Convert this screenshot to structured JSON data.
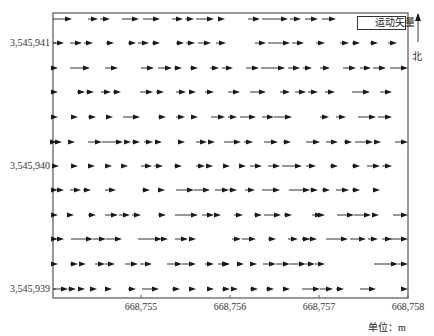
{
  "chart_data": {
    "type": "quiver",
    "title": "",
    "xlabel": "",
    "ylabel": "",
    "unit_label": "单位：m",
    "legend": [
      {
        "label": "运动矢量",
        "symbol": "arrow"
      }
    ],
    "north_label": "北",
    "x_ticks": [
      {
        "label": "668,755",
        "px": 141
      },
      {
        "label": "668,756",
        "px": 230
      },
      {
        "label": "668,757",
        "px": 319
      },
      {
        "label": "668,758",
        "px": 408
      }
    ],
    "y_ticks": [
      {
        "label": "3,545,941",
        "px": 43
      },
      {
        "label": "3,545,940",
        "px": 166
      },
      {
        "label": "3,545,939",
        "px": 289
      }
    ],
    "xlim": [
      668754.0,
      668758.0
    ],
    "ylim": [
      3545938.93,
      3545941.25
    ],
    "grid": false,
    "direction": "east",
    "frame": {
      "left": 53,
      "top": 13,
      "right": 408,
      "bottom": 298
    },
    "rows": [
      {
        "y": 19,
        "arrows": [
          [
            53,
            72
          ],
          [
            88,
            98
          ],
          [
            100,
            110
          ],
          [
            122,
            139
          ],
          [
            143,
            160
          ],
          [
            172,
            183
          ],
          [
            185,
            194
          ],
          [
            196,
            214
          ],
          [
            218,
            225
          ],
          [
            248,
            260
          ],
          [
            262,
            288
          ],
          [
            290,
            301
          ],
          [
            305,
            318
          ],
          [
            322,
            336
          ]
        ]
      },
      {
        "y": 43,
        "arrows": [
          [
            53,
            64
          ],
          [
            70,
            82
          ],
          [
            84,
            93
          ],
          [
            106,
            114
          ],
          [
            128,
            136
          ],
          [
            138,
            149
          ],
          [
            152,
            160
          ],
          [
            176,
            184
          ],
          [
            186,
            195
          ],
          [
            198,
            211
          ],
          [
            216,
            226
          ],
          [
            255,
            266
          ],
          [
            268,
            290
          ],
          [
            292,
            304
          ],
          [
            316,
            325
          ],
          [
            340,
            349
          ],
          [
            352,
            360
          ],
          [
            370,
            378
          ],
          [
            388,
            397
          ]
        ]
      },
      {
        "y": 68,
        "arrows": [
          [
            53,
            58
          ],
          [
            70,
            90
          ],
          [
            105,
            118
          ],
          [
            141,
            154
          ],
          [
            158,
            172
          ],
          [
            174,
            182
          ],
          [
            190,
            198
          ],
          [
            210,
            219
          ],
          [
            222,
            233
          ],
          [
            246,
            259
          ],
          [
            261,
            285
          ],
          [
            288,
            300
          ],
          [
            303,
            312
          ],
          [
            320,
            330
          ],
          [
            343,
            356
          ],
          [
            360,
            371
          ],
          [
            373,
            386
          ],
          [
            390,
            408
          ]
        ]
      },
      {
        "y": 92,
        "arrows": [
          [
            53,
            58
          ],
          [
            77,
            85
          ],
          [
            86,
            94
          ],
          [
            101,
            111
          ],
          [
            113,
            121
          ],
          [
            140,
            153
          ],
          [
            156,
            164
          ],
          [
            176,
            186
          ],
          [
            190,
            196
          ],
          [
            205,
            214
          ],
          [
            228,
            240
          ],
          [
            250,
            266
          ],
          [
            280,
            290
          ],
          [
            295,
            306
          ],
          [
            308,
            318
          ],
          [
            325,
            335
          ],
          [
            352,
            370
          ],
          [
            380,
            392
          ]
        ]
      },
      {
        "y": 117,
        "arrows": [
          [
            53,
            58
          ],
          [
            71,
            78
          ],
          [
            88,
            96
          ],
          [
            106,
            113
          ],
          [
            123,
            140
          ],
          [
            158,
            166
          ],
          [
            176,
            185
          ],
          [
            193,
            198
          ],
          [
            211,
            225
          ],
          [
            228,
            237
          ],
          [
            240,
            256
          ],
          [
            262,
            274
          ],
          [
            274,
            292
          ],
          [
            320,
            329
          ],
          [
            336,
            346
          ],
          [
            358,
            376
          ],
          [
            378,
            392
          ]
        ]
      },
      {
        "y": 142,
        "arrows": [
          [
            53,
            57
          ],
          [
            57,
            62
          ],
          [
            69,
            75
          ],
          [
            88,
            102
          ],
          [
            102,
            123
          ],
          [
            125,
            131
          ],
          [
            132,
            140
          ],
          [
            144,
            153
          ],
          [
            156,
            162
          ],
          [
            178,
            185
          ],
          [
            196,
            207
          ],
          [
            209,
            215
          ],
          [
            224,
            241
          ],
          [
            244,
            253
          ],
          [
            264,
            278
          ],
          [
            283,
            291
          ],
          [
            306,
            320
          ],
          [
            326,
            338
          ],
          [
            344,
            352
          ],
          [
            355,
            373
          ],
          [
            375,
            381
          ],
          [
            395,
            408
          ]
        ]
      },
      {
        "y": 166,
        "arrows": [
          [
            53,
            59
          ],
          [
            72,
            78
          ],
          [
            89,
            95
          ],
          [
            106,
            112
          ],
          [
            121,
            128
          ],
          [
            141,
            152
          ],
          [
            154,
            163
          ],
          [
            174,
            182
          ],
          [
            196,
            205
          ],
          [
            207,
            213
          ],
          [
            225,
            230
          ],
          [
            240,
            246
          ],
          [
            250,
            262
          ],
          [
            268,
            280
          ],
          [
            282,
            302
          ],
          [
            306,
            316
          ],
          [
            330,
            338
          ],
          [
            352,
            360
          ],
          [
            367,
            380
          ],
          [
            382,
            392
          ]
        ]
      },
      {
        "y": 190,
        "arrows": [
          [
            53,
            58
          ],
          [
            58,
            64
          ],
          [
            70,
            81
          ],
          [
            83,
            91
          ],
          [
            105,
            116
          ],
          [
            142,
            150
          ],
          [
            159,
            165
          ],
          [
            176,
            194
          ],
          [
            194,
            210
          ],
          [
            215,
            229
          ],
          [
            229,
            237
          ],
          [
            245,
            255
          ],
          [
            262,
            280
          ],
          [
            289,
            310
          ],
          [
            310,
            318
          ],
          [
            322,
            330
          ],
          [
            336,
            349
          ],
          [
            352,
            360
          ],
          [
            374,
            380
          ]
        ]
      },
      {
        "y": 215,
        "arrows": [
          [
            53,
            58
          ],
          [
            68,
            74
          ],
          [
            88,
            96
          ],
          [
            105,
            118
          ],
          [
            119,
            130
          ],
          [
            132,
            141
          ],
          [
            158,
            166
          ],
          [
            175,
            198
          ],
          [
            202,
            214
          ],
          [
            214,
            221
          ],
          [
            234,
            243
          ],
          [
            254,
            262
          ],
          [
            264,
            281
          ],
          [
            284,
            292
          ],
          [
            312,
            322
          ],
          [
            322,
            325
          ],
          [
            337,
            354
          ],
          [
            354,
            371
          ],
          [
            374,
            379
          ],
          [
            393,
            408
          ]
        ]
      },
      {
        "y": 239,
        "arrows": [
          [
            53,
            58
          ],
          [
            58,
            64
          ],
          [
            71,
            93
          ],
          [
            93,
            106
          ],
          [
            106,
            122
          ],
          [
            138,
            162
          ],
          [
            162,
            168
          ],
          [
            175,
            188
          ],
          [
            190,
            196
          ],
          [
            232,
            241
          ],
          [
            242,
            256
          ],
          [
            268,
            276
          ],
          [
            288,
            298
          ],
          [
            302,
            310
          ],
          [
            302,
            317
          ],
          [
            326,
            348
          ],
          [
            350,
            366
          ],
          [
            368,
            378
          ],
          [
            382,
            392
          ],
          [
            390,
            408
          ]
        ]
      },
      {
        "y": 264,
        "arrows": [
          [
            53,
            58
          ],
          [
            70,
            78
          ],
          [
            82,
            86
          ],
          [
            95,
            105
          ],
          [
            105,
            115
          ],
          [
            125,
            138
          ],
          [
            140,
            152
          ],
          [
            167,
            182
          ],
          [
            182,
            196
          ],
          [
            205,
            214
          ],
          [
            218,
            229
          ],
          [
            227,
            230
          ],
          [
            237,
            244
          ],
          [
            251,
            257
          ],
          [
            263,
            276
          ],
          [
            276,
            290
          ],
          [
            290,
            306
          ],
          [
            306,
            315
          ],
          [
            315,
            325
          ],
          [
            374,
            398
          ],
          [
            398,
            408
          ]
        ]
      },
      {
        "y": 289,
        "arrows": [
          [
            53,
            68
          ],
          [
            68,
            76
          ],
          [
            78,
            85
          ],
          [
            90,
            97
          ],
          [
            105,
            112
          ],
          [
            128,
            136
          ],
          [
            142,
            159
          ],
          [
            172,
            180
          ],
          [
            190,
            196
          ],
          [
            208,
            214
          ],
          [
            222,
            230
          ],
          [
            233,
            238
          ],
          [
            250,
            258
          ],
          [
            266,
            274
          ],
          [
            284,
            290
          ],
          [
            302,
            320
          ],
          [
            320,
            333
          ],
          [
            336,
            344
          ],
          [
            360,
            376
          ],
          [
            405,
            408
          ]
        ]
      }
    ]
  },
  "axes": {
    "y_labels": [
      "3,545,941",
      "3,545,940",
      "3,545,939"
    ],
    "x_labels": [
      "668,755",
      "668,756",
      "668,757",
      "668,758"
    ]
  },
  "legend": {
    "label": "运动矢量"
  },
  "north": {
    "label": "北"
  },
  "unit": {
    "label": "单位：m"
  },
  "colors": {
    "arrow": "#1a1a1a",
    "frame": "#555555",
    "text": "#333333"
  }
}
